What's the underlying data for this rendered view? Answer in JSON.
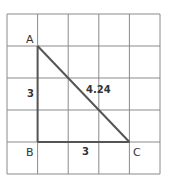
{
  "diagram": {
    "grid": {
      "cols": 5,
      "rows": 5,
      "line_color": "#8a8a8a"
    },
    "triangle": {
      "vertices": [
        {
          "label": "A",
          "grid_x": 1,
          "grid_y": 1
        },
        {
          "label": "B",
          "grid_x": 1,
          "grid_y": 4
        },
        {
          "label": "C",
          "grid_x": 4,
          "grid_y": 4
        }
      ],
      "line_color": "#555555",
      "sides": {
        "AB": "3",
        "BC": "3",
        "AC": "4.24"
      }
    }
  }
}
